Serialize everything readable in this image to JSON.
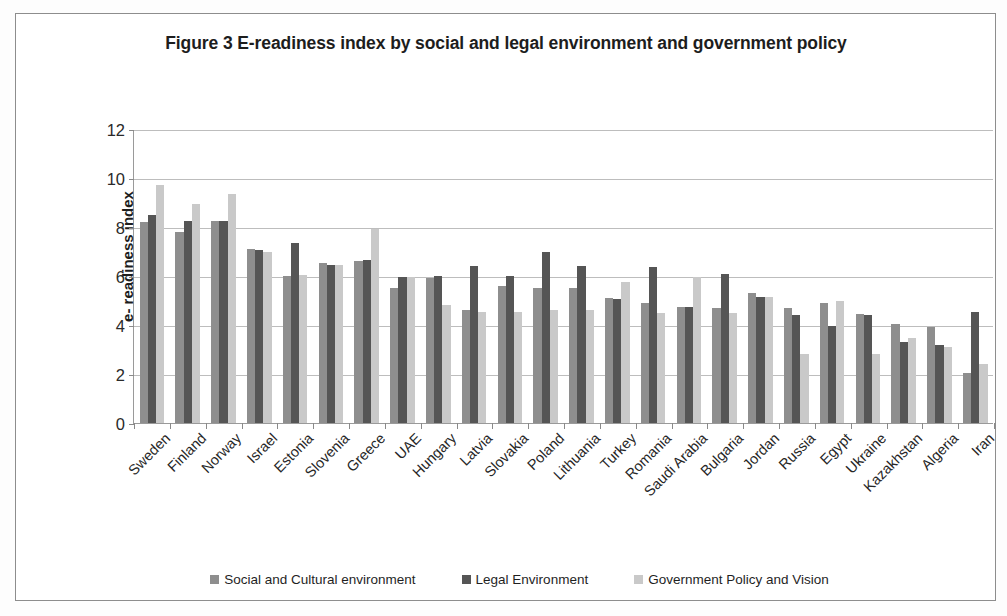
{
  "chart_data": {
    "type": "bar",
    "title": "Figure 3 E-readiness index by social and legal environment and government policy",
    "xlabel": "",
    "ylabel": "e- readiness index",
    "ylim": [
      0,
      12
    ],
    "yticks": [
      0,
      2,
      4,
      6,
      8,
      10,
      12
    ],
    "grid": true,
    "legend_position": "bottom",
    "categories": [
      "Sweden",
      "Finland",
      "Norway",
      "Israel",
      "Estonia",
      "Slovenia",
      "Greece",
      "UAE",
      "Hungary",
      "Latvia",
      "Slovakia",
      "Poland",
      "Lithuania",
      "Turkey",
      "Romania",
      "Saudi Arabia",
      "Bulgaria",
      "Jordan",
      "Russia",
      "Egypt",
      "Ukraine",
      "Kazakhstan",
      "Algeria",
      "Iran"
    ],
    "series": [
      {
        "name": "Social and Cultural environment",
        "color": "#8e8e8e",
        "values": [
          8.2,
          7.8,
          8.25,
          7.1,
          6.0,
          6.55,
          6.6,
          5.5,
          5.9,
          4.6,
          5.6,
          5.5,
          5.5,
          5.1,
          4.9,
          4.75,
          4.7,
          5.3,
          4.7,
          4.9,
          4.45,
          4.05,
          3.9,
          2.05
        ],
        "marker": ""
      },
      {
        "name": "Legal Environment",
        "color": "#555555",
        "values": [
          8.5,
          8.25,
          8.25,
          7.05,
          7.35,
          6.45,
          6.65,
          5.95,
          6.0,
          6.4,
          6.0,
          7.0,
          6.4,
          5.05,
          6.35,
          4.75,
          6.1,
          5.15,
          4.4,
          3.95,
          4.4,
          3.3,
          3.2,
          4.55
        ],
        "marker": ""
      },
      {
        "name": "Government Policy and Vision",
        "color": "#c9c9c9",
        "values": [
          9.7,
          8.95,
          9.35,
          7.0,
          6.05,
          6.45,
          7.9,
          5.95,
          4.8,
          4.55,
          4.55,
          4.6,
          4.6,
          5.75,
          4.5,
          5.95,
          4.5,
          5.15,
          2.8,
          5.0,
          2.8,
          3.45,
          3.1,
          2.4
        ],
        "marker": ""
      }
    ]
  },
  "legend": {
    "items": [
      {
        "label": "Social and Cultural environment",
        "color": "#8e8e8e"
      },
      {
        "label": "Legal Environment",
        "color": "#555555"
      },
      {
        "label": "Government Policy and Vision",
        "color": "#c9c9c9"
      }
    ]
  }
}
